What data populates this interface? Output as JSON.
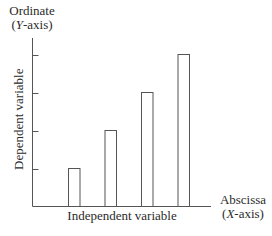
{
  "diagram": {
    "title_y": {
      "line1": "Ordinate",
      "line2_prefix": "(",
      "line2_italic": "Y",
      "line2_suffix": "-axis)"
    },
    "title_x": {
      "line1": "Abscissa",
      "line2_prefix": "(",
      "line2_italic": "X",
      "line2_suffix": "-axis)"
    },
    "xlabel": "Independent variable",
    "ylabel": "Dependent variable",
    "stroke_color": "#555555"
  },
  "chart_data": {
    "type": "bar",
    "title": "",
    "xlabel": "Independent variable",
    "ylabel": "Dependent variable",
    "x_axis_name": "Abscissa (X-axis)",
    "y_axis_name": "Ordinate (Y-axis)",
    "categories": [
      "1",
      "2",
      "3",
      "4"
    ],
    "values": [
      1,
      2,
      3,
      4
    ],
    "ylim": [
      0,
      4.4
    ],
    "y_ticks": [
      1,
      2,
      3,
      4
    ],
    "grid": false,
    "bar_fill": "none"
  }
}
